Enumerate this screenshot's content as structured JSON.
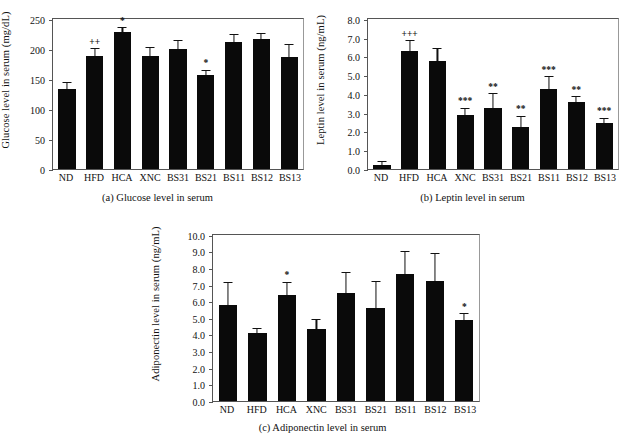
{
  "figure": {
    "categories": [
      "ND",
      "HFD",
      "HCA",
      "XNC",
      "BS31",
      "BS21",
      "BS11",
      "BS12",
      "BS13"
    ]
  },
  "chart_data": [
    {
      "type": "bar",
      "panel": "a",
      "title": "(a)  Glucose level in serum",
      "caption": "(a)  Glucose level in serum",
      "xlabel": "",
      "ylabel": "Glucose level in serum (mg/dL)",
      "ylim": [
        0,
        250
      ],
      "yticks": [
        0,
        50,
        100,
        150,
        200,
        250
      ],
      "ytick_labels": [
        "0",
        "50",
        "100",
        "150",
        "200",
        "250"
      ],
      "grid": false,
      "categories": [
        "ND",
        "HFD",
        "HCA",
        "XNC",
        "BS31",
        "BS21",
        "BS11",
        "BS12",
        "BS13"
      ],
      "values": [
        134,
        189,
        228,
        188,
        200,
        157,
        211,
        216,
        186
      ],
      "errors": [
        9,
        11,
        7,
        14,
        13,
        7,
        13,
        9,
        20
      ],
      "annotations": [
        "",
        "++",
        "*",
        "",
        "",
        "*",
        "",
        "",
        ""
      ]
    },
    {
      "type": "bar",
      "panel": "b",
      "title": "(b)  Leptin level in serum",
      "caption": "(b)  Leptin level in serum",
      "xlabel": "",
      "ylabel": "Leptin level in serum (ng/mL)",
      "ylim": [
        0,
        8
      ],
      "yticks": [
        0,
        1,
        2,
        3,
        4,
        5,
        6,
        7,
        8
      ],
      "ytick_labels": [
        "0.0",
        "1.0",
        "2.0",
        "3.0",
        "4.0",
        "5.0",
        "6.0",
        "7.0",
        "8.0"
      ],
      "grid": false,
      "categories": [
        "ND",
        "HFD",
        "HCA",
        "XNC",
        "BS31",
        "BS21",
        "BS11",
        "BS12",
        "BS13"
      ],
      "values": [
        0.24,
        6.3,
        5.78,
        2.86,
        3.25,
        2.24,
        4.28,
        3.55,
        2.45
      ],
      "errors": [
        0.12,
        0.52,
        0.6,
        0.35,
        0.75,
        0.55,
        0.62,
        0.28,
        0.22
      ],
      "annotations": [
        "",
        "+++",
        "",
        "***",
        "**",
        "**",
        "***",
        "**",
        "***"
      ]
    },
    {
      "type": "bar",
      "panel": "c",
      "title": "(c)  Adiponectin level in serum",
      "caption": "(c)  Adiponectin level in serum",
      "xlabel": "",
      "ylabel": "Adiponectin level in serum (ng/mL)",
      "ylim": [
        0,
        10
      ],
      "yticks": [
        0,
        1,
        2,
        3,
        4,
        5,
        6,
        7,
        8,
        9,
        10
      ],
      "ytick_labels": [
        "0.0",
        "1.0",
        "2.0",
        "3.0",
        "4.0",
        "5.0",
        "6.0",
        "7.0",
        "8.0",
        "9.0",
        "10.0"
      ],
      "grid": false,
      "categories": [
        "ND",
        "HFD",
        "HCA",
        "XNC",
        "BS31",
        "BS21",
        "BS11",
        "BS12",
        "BS13"
      ],
      "values": [
        5.78,
        4.12,
        6.38,
        4.35,
        6.48,
        5.6,
        7.65,
        7.2,
        4.9
      ],
      "errors": [
        1.32,
        0.2,
        0.75,
        0.52,
        1.25,
        1.55,
        1.35,
        1.65,
        0.32
      ],
      "annotations": [
        "",
        "",
        "*",
        "",
        "",
        "",
        "",
        "",
        "*"
      ]
    }
  ]
}
